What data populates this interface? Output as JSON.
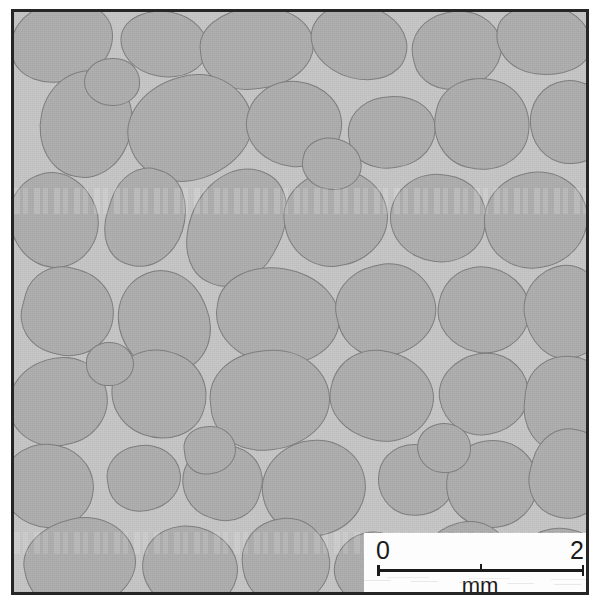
{
  "figure": {
    "kind": "photomicrograph",
    "frame_border_color": "#262626",
    "background_color": "#ffffff"
  },
  "micrograph": {
    "matrix_color": "#c6c6c6",
    "grain_fill_color": "#aeaeae",
    "grain_outline_color": "#7e7e7e",
    "frame": {
      "left": 11,
      "top": 9,
      "width": 578,
      "height": 586
    }
  },
  "scalebar": {
    "card_background": "#fdfdfd",
    "ink_color": "#1b1b1b",
    "tick_start_label": "0",
    "tick_end_label": "2",
    "unit_label": "mm",
    "length_value": 2,
    "minor_tick_count": 1
  },
  "grains": [
    {
      "cx": 48,
      "cy": 30,
      "rx": 52,
      "ry": 40,
      "rot": -14
    },
    {
      "cx": 150,
      "cy": 32,
      "rx": 44,
      "ry": 33,
      "rot": 10
    },
    {
      "cx": 243,
      "cy": 36,
      "rx": 57,
      "ry": 41,
      "rot": -6
    },
    {
      "cx": 345,
      "cy": 30,
      "rx": 49,
      "ry": 37,
      "rot": 16
    },
    {
      "cx": 443,
      "cy": 38,
      "rx": 45,
      "ry": 39,
      "rot": -12
    },
    {
      "cx": 530,
      "cy": 28,
      "rx": 48,
      "ry": 35,
      "rot": 8
    },
    {
      "cx": 72,
      "cy": 112,
      "rx": 46,
      "ry": 54,
      "rot": 12
    },
    {
      "cx": 176,
      "cy": 116,
      "rx": 63,
      "ry": 52,
      "rot": -18
    },
    {
      "cx": 280,
      "cy": 112,
      "rx": 48,
      "ry": 43,
      "rot": 6
    },
    {
      "cx": 378,
      "cy": 120,
      "rx": 44,
      "ry": 36,
      "rot": -9
    },
    {
      "cx": 468,
      "cy": 112,
      "rx": 48,
      "ry": 46,
      "rot": 14
    },
    {
      "cx": 556,
      "cy": 110,
      "rx": 40,
      "ry": 42,
      "rot": -7
    },
    {
      "cx": 40,
      "cy": 208,
      "rx": 44,
      "ry": 48,
      "rot": -20
    },
    {
      "cx": 132,
      "cy": 206,
      "rx": 39,
      "ry": 50,
      "rot": 18
    },
    {
      "cx": 222,
      "cy": 215,
      "rx": 46,
      "ry": 62,
      "rot": 28
    },
    {
      "cx": 322,
      "cy": 206,
      "rx": 52,
      "ry": 48,
      "rot": -11
    },
    {
      "cx": 424,
      "cy": 206,
      "rx": 48,
      "ry": 44,
      "rot": 7
    },
    {
      "cx": 522,
      "cy": 208,
      "rx": 52,
      "ry": 48,
      "rot": -16
    },
    {
      "cx": 54,
      "cy": 300,
      "rx": 46,
      "ry": 44,
      "rot": 15
    },
    {
      "cx": 150,
      "cy": 310,
      "rx": 45,
      "ry": 52,
      "rot": -22
    },
    {
      "cx": 264,
      "cy": 304,
      "rx": 62,
      "ry": 48,
      "rot": 9
    },
    {
      "cx": 372,
      "cy": 298,
      "rx": 50,
      "ry": 46,
      "rot": -13
    },
    {
      "cx": 470,
      "cy": 298,
      "rx": 46,
      "ry": 43,
      "rot": 11
    },
    {
      "cx": 552,
      "cy": 300,
      "rx": 42,
      "ry": 47,
      "rot": -8
    },
    {
      "cx": 44,
      "cy": 390,
      "rx": 50,
      "ry": 44,
      "rot": -17
    },
    {
      "cx": 145,
      "cy": 382,
      "rx": 48,
      "ry": 44,
      "rot": 20
    },
    {
      "cx": 256,
      "cy": 388,
      "rx": 60,
      "ry": 50,
      "rot": -6
    },
    {
      "cx": 368,
      "cy": 384,
      "rx": 52,
      "ry": 45,
      "rot": 13
    },
    {
      "cx": 470,
      "cy": 382,
      "rx": 45,
      "ry": 41,
      "rot": -10
    },
    {
      "cx": 554,
      "cy": 392,
      "rx": 44,
      "ry": 48,
      "rot": 6
    },
    {
      "cx": 34,
      "cy": 474,
      "rx": 46,
      "ry": 42,
      "rot": 12
    },
    {
      "cx": 130,
      "cy": 466,
      "rx": 37,
      "ry": 33,
      "rot": -9
    },
    {
      "cx": 208,
      "cy": 470,
      "rx": 40,
      "ry": 38,
      "rot": 17
    },
    {
      "cx": 300,
      "cy": 476,
      "rx": 52,
      "ry": 48,
      "rot": -14
    },
    {
      "cx": 402,
      "cy": 468,
      "rx": 38,
      "ry": 36,
      "rot": 8
    },
    {
      "cx": 478,
      "cy": 472,
      "rx": 46,
      "ry": 44,
      "rot": -11
    },
    {
      "cx": 556,
      "cy": 462,
      "rx": 40,
      "ry": 45,
      "rot": 15
    },
    {
      "cx": 66,
      "cy": 552,
      "rx": 56,
      "ry": 46,
      "rot": -12
    },
    {
      "cx": 176,
      "cy": 556,
      "rx": 48,
      "ry": 42,
      "rot": 14
    },
    {
      "cx": 272,
      "cy": 550,
      "rx": 44,
      "ry": 44,
      "rot": -7
    },
    {
      "cx": 362,
      "cy": 558,
      "rx": 42,
      "ry": 38,
      "rot": 10
    },
    {
      "cx": 452,
      "cy": 552,
      "rx": 46,
      "ry": 42,
      "rot": -15
    },
    {
      "cx": 548,
      "cy": 556,
      "rx": 44,
      "ry": 40,
      "rot": 9
    },
    {
      "cx": 98,
      "cy": 70,
      "rx": 28,
      "ry": 24,
      "rot": 0
    },
    {
      "cx": 318,
      "cy": 152,
      "rx": 30,
      "ry": 26,
      "rot": 12
    },
    {
      "cx": 196,
      "cy": 438,
      "rx": 26,
      "ry": 24,
      "rot": -8
    },
    {
      "cx": 430,
      "cy": 436,
      "rx": 27,
      "ry": 25,
      "rot": 6
    },
    {
      "cx": 96,
      "cy": 352,
      "rx": 24,
      "ry": 22,
      "rot": 0
    }
  ]
}
